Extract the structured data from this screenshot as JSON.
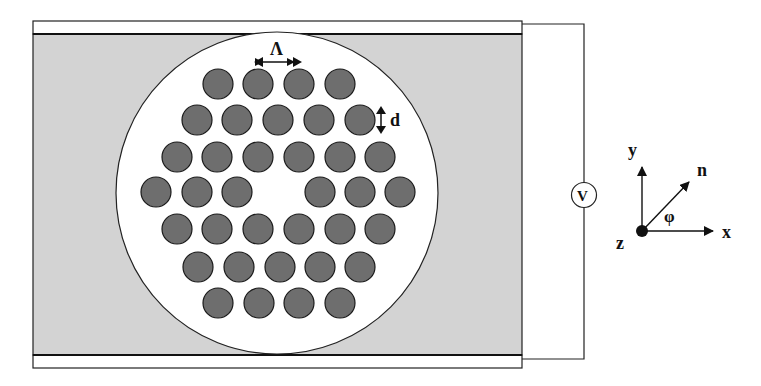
{
  "figure": {
    "type": "photonic-crystal-fiber-cross-section",
    "colors": {
      "background": "#ffffff",
      "cladding_fill": "#d3d3d3",
      "core_fill": "#ffffff",
      "hole_fill": "#6e6e6e",
      "stroke": "#1a1a1a"
    },
    "labels": {
      "pitch": "Λ",
      "hole_diameter": "d",
      "voltage_source": "V",
      "axis_y": "y",
      "axis_x": "x",
      "axis_z": "z",
      "director": "n",
      "angle": "φ"
    },
    "hole_lattice": {
      "rows": [
        {
          "y": 84,
          "x": [
            218,
            258,
            299,
            340
          ]
        },
        {
          "y": 120,
          "x": [
            197,
            237,
            278,
            319,
            360
          ]
        },
        {
          "y": 157,
          "x": [
            177,
            217,
            258,
            299,
            340,
            380
          ]
        },
        {
          "y": 192,
          "x": [
            156,
            197,
            237,
            320,
            360,
            400
          ]
        },
        {
          "y": 229,
          "x": [
            177,
            217,
            258,
            299,
            340,
            380
          ]
        },
        {
          "y": 267,
          "x": [
            198,
            239,
            280,
            320,
            360
          ]
        },
        {
          "y": 303,
          "x": [
            218,
            259,
            299,
            340
          ]
        }
      ],
      "hole_radius": 15,
      "missing_center_hole": true
    }
  }
}
